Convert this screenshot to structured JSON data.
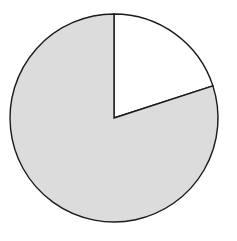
{
  "chart_data": {
    "type": "pie",
    "title": "",
    "labels": [
      "Slice A",
      "Slice B"
    ],
    "values": [
      20,
      80
    ],
    "colors": [
      "#ffffff",
      "#dcdcdc"
    ],
    "start_angle_deg": 0,
    "direction": "clockwise",
    "legend": "none",
    "stroke_color": "#1a1a1a"
  },
  "geometry": {
    "cx": 114,
    "cy": 118,
    "r": 104
  }
}
